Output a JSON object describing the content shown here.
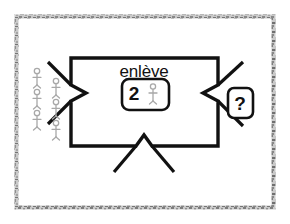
{
  "canvas": {
    "width": 290,
    "height": 224,
    "background": "#ffffff",
    "frame": {
      "name": "textured-gray-border",
      "color": "#9a9a9a",
      "inset": 15
    }
  },
  "diagram": {
    "type": "function-machine",
    "stroke_color": "#111111",
    "figure_color": "#a8a8a8",
    "machine_box": {
      "x": 71,
      "y": 58,
      "width": 147,
      "height": 88,
      "notch_label": "v-notch-arrow-inlets"
    },
    "operation": {
      "label": "enlève"
    },
    "operand": {
      "number": "2",
      "icon": "stick-figure-icon",
      "box_shape": "rounded-rectangle"
    },
    "output": {
      "label": "?",
      "box_shape": "rounded-rectangle"
    },
    "input_group": {
      "icon": "stick-figure-icon",
      "count": 6,
      "columns": [
        {
          "name": "input-column-left",
          "count": 3,
          "x": 37,
          "ys": [
            74,
            95,
            116
          ]
        },
        {
          "name": "input-column-right",
          "count": 3,
          "x": 55,
          "ys": [
            84,
            105,
            126
          ]
        }
      ]
    },
    "arrows": [
      {
        "name": "arrow-inlet-left",
        "direction": "right"
      },
      {
        "name": "arrow-outlet-right",
        "direction": "right"
      },
      {
        "name": "arrow-inlet-bottom",
        "direction": "up"
      }
    ]
  }
}
